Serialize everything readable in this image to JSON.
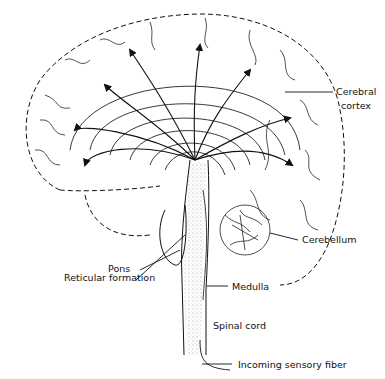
{
  "diagram": {
    "labels": {
      "cerebral_cortex_1": "Cerebral",
      "cerebral_cortex_2": "cortex",
      "cerebellum": "Cerebellum",
      "pons": "Pons",
      "reticular_formation": "Reticular formation",
      "medulla": "Medulla",
      "spinal_cord": "Spinal cord",
      "incoming_sensory_fiber": "Incoming sensory fiber"
    },
    "colors": {
      "ink": "#111111",
      "background": "#ffffff",
      "stipple": "#888888"
    }
  }
}
